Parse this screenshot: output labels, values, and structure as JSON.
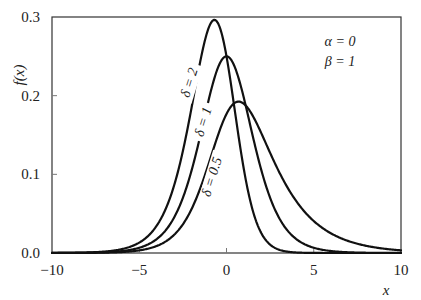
{
  "chart_data": {
    "type": "line",
    "title": "",
    "xlabel": "x",
    "ylabel": "f(x)",
    "xlim": [
      -10,
      10
    ],
    "ylim": [
      0,
      0.3
    ],
    "grid": false,
    "x_ticks": [
      -10,
      -5,
      0,
      5,
      10
    ],
    "x_tick_labels": [
      "−10",
      "−5",
      "0",
      "5",
      "10"
    ],
    "y_ticks": [
      0.0,
      0.1,
      0.2,
      0.3
    ],
    "y_tick_labels": [
      "0.0",
      "0.1",
      "0.2",
      "0.3"
    ],
    "parameters_annotation": [
      "α = 0",
      "β = 1"
    ],
    "formula_note": "f(x) = δ e^x / (1 + e^x)^(δ+1)",
    "series": [
      {
        "name": "δ = 2",
        "delta": 2,
        "mode_x": -0.69,
        "peak_y": 0.296,
        "x": [
          -10,
          -6,
          -4,
          -3,
          -2,
          -1.5,
          -1,
          -0.69,
          -0.3,
          0,
          0.5,
          1,
          1.5,
          2,
          3,
          4,
          5,
          6,
          8,
          10
        ],
        "y": [
          0.0001,
          0.0049,
          0.0335,
          0.083,
          0.1733,
          0.2322,
          0.2791,
          0.2963,
          0.2833,
          0.25,
          0.1742,
          0.1092,
          0.0636,
          0.0357,
          0.01,
          0.0028,
          0.0007,
          0.0002,
          0.0,
          0.0
        ],
        "label_pos": [
          -1.9,
          0.215
        ]
      },
      {
        "name": "δ = 1",
        "delta": 1,
        "mode_x": 0,
        "peak_y": 0.25,
        "x": [
          -10,
          -6,
          -4,
          -3,
          -2,
          -1,
          0,
          1,
          2,
          3,
          4,
          5,
          6,
          8,
          10
        ],
        "y": [
          0.0,
          0.0025,
          0.0177,
          0.0452,
          0.105,
          0.1966,
          0.25,
          0.1966,
          0.105,
          0.0452,
          0.0177,
          0.0066,
          0.0025,
          0.0003,
          0.0
        ],
        "label_pos": [
          -1.1,
          0.165
        ]
      },
      {
        "name": "δ = 0.5",
        "delta": 0.5,
        "mode_x": 0.69,
        "peak_y": 0.192,
        "x": [
          -10,
          -6,
          -4,
          -3,
          -2,
          -1,
          0,
          0.69,
          1,
          2,
          3,
          4,
          5,
          6,
          8,
          10
        ],
        "y": [
          0.0,
          0.0012,
          0.009,
          0.0232,
          0.0556,
          0.1114,
          0.1768,
          0.1925,
          0.1897,
          0.1522,
          0.0989,
          0.0574,
          0.0313,
          0.0164,
          0.0043,
          0.0011
        ],
        "label_pos": [
          -0.6,
          0.095
        ]
      }
    ],
    "legend": {
      "position": "none (inline curve labels)"
    }
  },
  "axes": {
    "x_title": "x",
    "y_title": "f(x)"
  },
  "annotation": {
    "line1": "α = 0",
    "line2": "β = 1"
  },
  "style": {
    "line_color": "#111111",
    "frame_color": "#333333",
    "background": "#ffffff"
  }
}
